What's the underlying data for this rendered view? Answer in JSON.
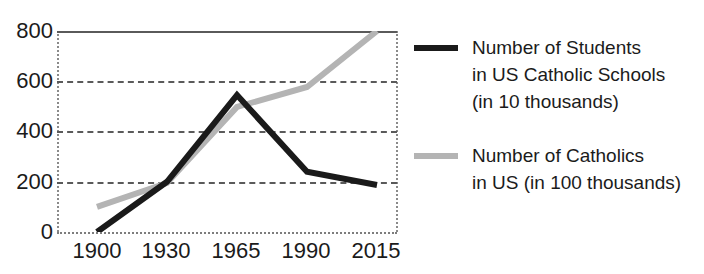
{
  "chart_data": {
    "type": "line",
    "title": "",
    "xlabel": "",
    "ylabel": "",
    "categories": [
      "1900",
      "1930",
      "1965",
      "1990",
      "2015"
    ],
    "ylim": [
      0,
      800
    ],
    "yticks": [
      "0",
      "200",
      "400",
      "600",
      "800"
    ],
    "grid": true,
    "legend_position": "right",
    "series": [
      {
        "name": "Number of Students in US Catholic Schools (in 10 thousands)",
        "color": "#1a1a1a",
        "values": [
          0,
          200,
          545,
          240,
          187
        ]
      },
      {
        "name": "Number of Catholics in US (in 100 thousands)",
        "color": "#b4b4b4",
        "values": [
          100,
          195,
          498,
          577,
          800
        ]
      }
    ]
  },
  "legend": {
    "entries": [
      {
        "swatch": "black-line-swatch",
        "line1": "Number of Students",
        "line2": "in US Catholic Schools",
        "line3": "(in 10 thousands)"
      },
      {
        "swatch": "gray-line-swatch",
        "line1": "Number of Catholics",
        "line2": "in US (in 100 thousands)",
        "line3": ""
      }
    ]
  }
}
